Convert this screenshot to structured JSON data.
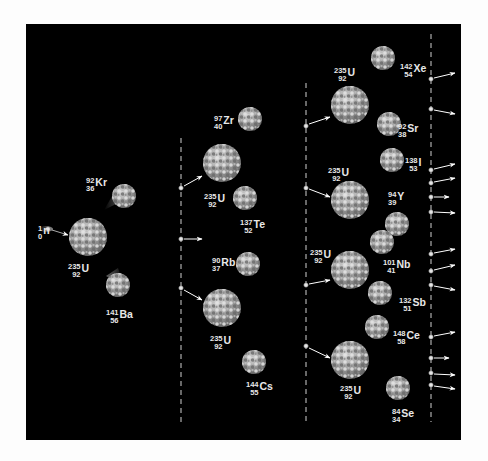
{
  "colors": {
    "background": "#fdfdfd",
    "panel": "#000000",
    "nucleus_light": "#d6d6d6",
    "nucleus_dark": "#6e6e6e",
    "text": "#e8e8e8",
    "dashes": "#d0d0d0",
    "arrow": "#ffffff"
  },
  "generations": [
    {
      "name": "generation-1",
      "incoming_neutron": {
        "mass": "1",
        "atomic": "0",
        "symbol": "n"
      },
      "nuclei": [
        {
          "mass": "235",
          "atomic": "92",
          "symbol": "U",
          "products": [
            {
              "mass": "92",
              "atomic": "36",
              "symbol": "Kr"
            },
            {
              "mass": "141",
              "atomic": "56",
              "symbol": "Ba"
            }
          ]
        }
      ],
      "released_neutrons": 3
    },
    {
      "name": "generation-2",
      "nuclei": [
        {
          "mass": "235",
          "atomic": "92",
          "symbol": "U",
          "products": [
            {
              "mass": "97",
              "atomic": "40",
              "symbol": "Zr"
            },
            {
              "mass": "137",
              "atomic": "52",
              "symbol": "Te"
            }
          ]
        },
        {
          "mass": "235",
          "atomic": "92",
          "symbol": "U",
          "products": [
            {
              "mass": "90",
              "atomic": "37",
              "symbol": "Rb"
            },
            {
              "mass": "144",
              "atomic": "55",
              "symbol": "Cs"
            }
          ]
        }
      ]
    },
    {
      "name": "generation-3",
      "nuclei": [
        {
          "mass": "235",
          "atomic": "92",
          "symbol": "U",
          "products": [
            {
              "mass": "142",
              "atomic": "54",
              "symbol": "Xe"
            },
            {
              "mass": "92",
              "atomic": "38",
              "symbol": "Sr"
            }
          ]
        },
        {
          "mass": "235",
          "atomic": "92",
          "symbol": "U",
          "products": [
            {
              "mass": "138",
              "atomic": "53",
              "symbol": "I"
            },
            {
              "mass": "94",
              "atomic": "39",
              "symbol": "Y"
            }
          ]
        },
        {
          "mass": "235",
          "atomic": "92",
          "symbol": "U",
          "products": [
            {
              "mass": "101",
              "atomic": "41",
              "symbol": "Nb"
            },
            {
              "mass": "132",
              "atomic": "51",
              "symbol": "Sb"
            }
          ]
        },
        {
          "mass": "235",
          "atomic": "92",
          "symbol": "U",
          "products": [
            {
              "mass": "148",
              "atomic": "58",
              "symbol": "Ce"
            },
            {
              "mass": "84",
              "atomic": "34",
              "symbol": "Se"
            }
          ]
        }
      ],
      "outgoing_neutrons": 12
    }
  ],
  "labels": [
    {
      "id": "n0",
      "mass": "1",
      "atomic": "0",
      "symbol": "n",
      "x": 38,
      "y": 224
    },
    {
      "id": "u1",
      "mass": "235",
      "atomic": "92",
      "symbol": "U",
      "x": 68,
      "y": 262
    },
    {
      "id": "kr",
      "mass": "92",
      "atomic": "36",
      "symbol": "Kr",
      "x": 86,
      "y": 176
    },
    {
      "id": "ba",
      "mass": "141",
      "atomic": "56",
      "symbol": "Ba",
      "x": 106,
      "y": 308
    },
    {
      "id": "zr",
      "mass": "97",
      "atomic": "40",
      "symbol": "Zr",
      "x": 214,
      "y": 114
    },
    {
      "id": "u2a",
      "mass": "235",
      "atomic": "92",
      "symbol": "U",
      "x": 204,
      "y": 192
    },
    {
      "id": "te",
      "mass": "137",
      "atomic": "52",
      "symbol": "Te",
      "x": 240,
      "y": 218
    },
    {
      "id": "rb",
      "mass": "90",
      "atomic": "37",
      "symbol": "Rb",
      "x": 212,
      "y": 256
    },
    {
      "id": "u2b",
      "mass": "235",
      "atomic": "92",
      "symbol": "U",
      "x": 210,
      "y": 334
    },
    {
      "id": "cs",
      "mass": "144",
      "atomic": "55",
      "symbol": "Cs",
      "x": 246,
      "y": 380
    },
    {
      "id": "u3a",
      "mass": "235",
      "atomic": "92",
      "symbol": "U",
      "x": 334,
      "y": 66
    },
    {
      "id": "xe",
      "mass": "142",
      "atomic": "54",
      "symbol": "Xe",
      "x": 400,
      "y": 62
    },
    {
      "id": "sr",
      "mass": "92",
      "atomic": "38",
      "symbol": "Sr",
      "x": 398,
      "y": 122
    },
    {
      "id": "u3b",
      "mass": "235",
      "atomic": "92",
      "symbol": "U",
      "x": 328,
      "y": 166
    },
    {
      "id": "i",
      "mass": "138",
      "atomic": "53",
      "symbol": "I",
      "x": 405,
      "y": 156
    },
    {
      "id": "y",
      "mass": "94",
      "atomic": "39",
      "symbol": "Y",
      "x": 388,
      "y": 190
    },
    {
      "id": "u3c",
      "mass": "235",
      "atomic": "92",
      "symbol": "U",
      "x": 310,
      "y": 248
    },
    {
      "id": "nb",
      "mass": "101",
      "atomic": "41",
      "symbol": "Nb",
      "x": 383,
      "y": 258
    },
    {
      "id": "sb",
      "mass": "132",
      "atomic": "51",
      "symbol": "Sb",
      "x": 399,
      "y": 296
    },
    {
      "id": "ce",
      "mass": "148",
      "atomic": "58",
      "symbol": "Ce",
      "x": 393,
      "y": 329
    },
    {
      "id": "u3d",
      "mass": "235",
      "atomic": "92",
      "symbol": "U",
      "x": 340,
      "y": 384
    },
    {
      "id": "se",
      "mass": "84",
      "atomic": "34",
      "symbol": "Se",
      "x": 392,
      "y": 407
    }
  ]
}
